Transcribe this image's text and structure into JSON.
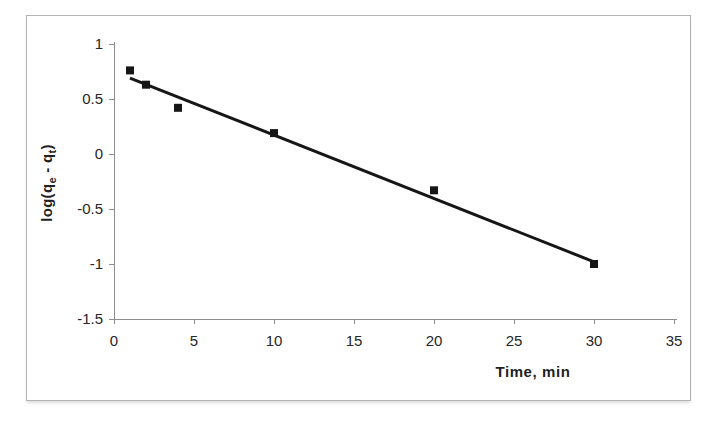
{
  "figure": {
    "background": "#ffffff",
    "frame_border_color": "#b3b3b3"
  },
  "chart_data": {
    "type": "scatter",
    "title": "",
    "xlabel": "Time, min",
    "ylabel": "log(qe - qt)",
    "ylabel_parts": [
      "log(q",
      "e",
      " - q",
      "t",
      ")"
    ],
    "x": [
      1,
      2,
      4,
      10,
      20,
      30
    ],
    "y": [
      0.76,
      0.63,
      0.42,
      0.19,
      -0.33,
      -1.0
    ],
    "xlim": [
      0,
      35
    ],
    "ylim": [
      -1.5,
      1
    ],
    "x_ticks": [
      0,
      5,
      10,
      15,
      20,
      25,
      30,
      35
    ],
    "x_tick_labels": [
      "0",
      "5",
      "10",
      "15",
      "20",
      "25",
      "30",
      "35"
    ],
    "y_ticks": [
      1,
      0.5,
      0,
      -0.5,
      -1,
      -1.5
    ],
    "y_tick_labels": [
      "1",
      "0.5",
      "0",
      "-0.5",
      "-1",
      "-1.5"
    ],
    "grid": false,
    "legend": "none",
    "marker": {
      "shape": "square",
      "size": 8,
      "color": "#161616"
    },
    "trendline": {
      "type": "linear",
      "slope": -0.0576,
      "intercept": 0.748,
      "x_start": 1,
      "y_start": 0.69,
      "x_end": 30,
      "y_end": -0.98,
      "color": "#161616",
      "width": 3
    },
    "axis_color": "#8c8c8c",
    "tick_label_color": "#262626",
    "axis_title_color": "#1f1f1f",
    "tick_label_font_size": 15
  }
}
